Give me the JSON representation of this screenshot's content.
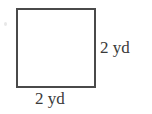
{
  "figure": {
    "shape_name": "square",
    "unit": "yd",
    "side_length": 2,
    "labels": {
      "right": "2 yd",
      "bottom": "2 yd"
    },
    "colors": {
      "stroke": "#4a4a4a",
      "fill": "#ffffff",
      "text": "#3a3a3a",
      "background": "#ffffff"
    }
  },
  "chart_data": {
    "type": "diagram",
    "shape": "square",
    "title": "",
    "sides": [
      {
        "position": "bottom",
        "label": "2 yd",
        "value": 2,
        "unit": "yd"
      },
      {
        "position": "right",
        "label": "2 yd",
        "value": 2,
        "unit": "yd"
      }
    ]
  }
}
